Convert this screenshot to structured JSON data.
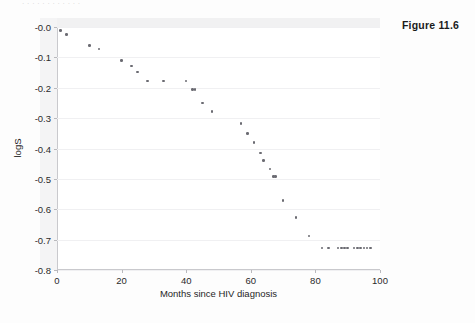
{
  "figure": {
    "label": "Figure 11.6",
    "top_caption_ghost": "· · ·  ·  ·  · ·     ·      ·       ·    ·    ·"
  },
  "chart_data": {
    "type": "scatter",
    "title": "",
    "subtitle": "",
    "xlabel": "Months since HIV diagnosis",
    "ylabel": "logS",
    "xlim": [
      0,
      100
    ],
    "ylim": [
      -0.8,
      0.0
    ],
    "xticks": [
      0,
      20,
      40,
      60,
      80,
      100
    ],
    "xtick_labels": [
      "0",
      "20",
      "40",
      "60",
      "80",
      "100"
    ],
    "yticks": [
      0.0,
      -0.1,
      -0.2,
      -0.3,
      -0.4,
      -0.5,
      -0.6,
      -0.7,
      -0.8
    ],
    "ytick_labels": [
      "-0.0",
      "-0.1",
      "-0.2",
      "-0.3",
      "-0.4",
      "-0.5",
      "-0.6",
      "-0.7",
      "-0.8"
    ],
    "grid": true,
    "grid_axis": "y",
    "legend": false,
    "legend_position": "none",
    "marker": {
      "shape": "circle",
      "color": "#6b6b72",
      "size_px": 2.6
    },
    "series": [
      {
        "name": "logS",
        "points": [
          {
            "x": 1,
            "y": -0.012,
            "n": 1
          },
          {
            "x": 3,
            "y": -0.025,
            "n": 1
          },
          {
            "x": 10,
            "y": -0.06,
            "n": 1
          },
          {
            "x": 13,
            "y": -0.073,
            "n": 1
          },
          {
            "x": 20,
            "y": -0.11,
            "n": 1
          },
          {
            "x": 23,
            "y": -0.128,
            "n": 1
          },
          {
            "x": 25,
            "y": -0.148,
            "n": 1
          },
          {
            "x": 28,
            "y": -0.178,
            "n": 1
          },
          {
            "x": 33,
            "y": -0.178,
            "n": 1
          },
          {
            "x": 40,
            "y": -0.178,
            "n": 1
          },
          {
            "x": 42,
            "y": -0.205,
            "n": 2
          },
          {
            "x": 45,
            "y": -0.25,
            "n": 1
          },
          {
            "x": 48,
            "y": -0.278,
            "n": 1
          },
          {
            "x": 57,
            "y": -0.318,
            "n": 1
          },
          {
            "x": 59,
            "y": -0.35,
            "n": 1
          },
          {
            "x": 61,
            "y": -0.38,
            "n": 1
          },
          {
            "x": 63,
            "y": -0.415,
            "n": 1
          },
          {
            "x": 64,
            "y": -0.44,
            "n": 1
          },
          {
            "x": 66,
            "y": -0.468,
            "n": 1
          },
          {
            "x": 67,
            "y": -0.492,
            "n": 2
          },
          {
            "x": 70,
            "y": -0.572,
            "n": 1
          },
          {
            "x": 74,
            "y": -0.628,
            "n": 1
          },
          {
            "x": 78,
            "y": -0.688,
            "n": 1
          },
          {
            "x": 82,
            "y": -0.728,
            "n": 1
          },
          {
            "x": 84,
            "y": -0.728,
            "n": 1
          },
          {
            "x": 87,
            "y": -0.728,
            "n": 1
          },
          {
            "x": 88,
            "y": -0.728,
            "n": 1
          },
          {
            "x": 89,
            "y": -0.728,
            "n": 1
          },
          {
            "x": 90,
            "y": -0.728,
            "n": 1
          },
          {
            "x": 92,
            "y": -0.728,
            "n": 1
          },
          {
            "x": 93,
            "y": -0.728,
            "n": 1
          },
          {
            "x": 94,
            "y": -0.728,
            "n": 1
          },
          {
            "x": 95,
            "y": -0.728,
            "n": 1
          },
          {
            "x": 96,
            "y": -0.728,
            "n": 1
          },
          {
            "x": 97,
            "y": -0.728,
            "n": 1
          }
        ]
      }
    ],
    "annotations": [
      {
        "text": "Figure 11.6",
        "position": "outside-top-right"
      }
    ]
  }
}
